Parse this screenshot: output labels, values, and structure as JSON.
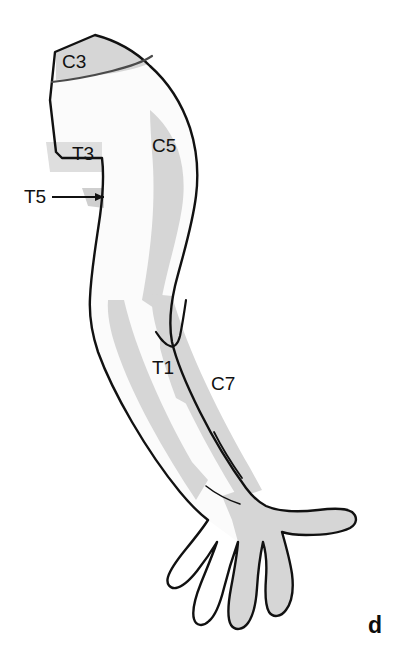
{
  "figure": {
    "panel_letter": "d",
    "colors": {
      "background": "#ffffff",
      "skin_light": "#fbfbfb",
      "dermatome_shade": "#d6d6d6",
      "dermatome_shade_soft": "#dedede",
      "outline": "#111111",
      "label_text": "#111111"
    },
    "labels": [
      {
        "id": "c3",
        "text": "C3",
        "x": 62,
        "y": 68
      },
      {
        "id": "c5",
        "text": "C5",
        "x": 152,
        "y": 152
      },
      {
        "id": "t3",
        "text": "T3",
        "x": 72,
        "y": 160
      },
      {
        "id": "t5",
        "text": "T5",
        "x": 24,
        "y": 203
      },
      {
        "id": "t1",
        "text": "T1",
        "x": 152,
        "y": 374
      },
      {
        "id": "c7",
        "text": "C7",
        "x": 211,
        "y": 390
      }
    ],
    "leader_lines": [
      {
        "id": "t5-leader",
        "from_x": 52,
        "from_y": 197,
        "to_x": 104,
        "to_y": 197
      }
    ],
    "shapes": {
      "body_outline": "M 55 52 L 95 35 C 118 41 136 52 150 66 C 168 82 182 104 190 128 C 197 150 199 172 196 196 C 192 228 182 258 175 286 C 170 308 169 326 172 342 C 177 364 188 388 200 412 C 214 440 230 466 246 488 C 252 496 258 502 266 506 C 280 512 300 512 318 510 C 334 508 346 508 352 512 C 358 517 357 524 350 528 C 340 533 322 535 306 535 C 296 535 288 534 282 532 C 286 546 290 560 292 574 C 294 590 292 602 286 610 C 281 617 273 618 269 612 C 265 605 265 592 266 578 C 267 564 266 552 263 542 C 260 556 258 572 257 588 C 256 604 253 616 248 623 C 243 630 235 631 231 625 C 227 618 228 604 231 588 C 234 572 237 556 238 542 C 233 556 228 572 224 588 C 220 604 215 616 209 621 C 203 627 196 626 194 619 C 192 612 195 598 201 583 C 207 568 213 554 217 542 C 211 552 204 562 197 571 C 189 581 182 587 176 588 C 170 589 166 584 168 577 C 170 570 177 560 186 549 C 195 538 203 528 208 520 C 200 514 190 504 180 492 C 162 470 146 446 132 422 C 118 398 106 374 98 352 C 92 334 89 316 90 298 C 91 272 96 244 100 216 C 103 194 104 174 102 158 L 62 158 L 56 152 L 50 100 Z",
      "skin_base": "M 55 52 L 95 35 C 118 41 136 52 150 66 C 168 82 182 104 190 128 C 197 150 199 172 196 196 C 192 228 182 258 175 286 C 170 308 169 326 172 342 C 177 364 188 388 200 412 C 214 440 230 466 246 488 L 266 506 L 282 532 L 238 542 L 208 520 L 180 492 C 162 470 146 446 132 422 C 118 398 106 374 98 352 C 92 334 89 316 90 298 C 91 272 96 244 100 216 C 103 194 104 174 102 158 L 62 158 L 56 152 L 50 100 Z",
      "c3_patch": "M 56 52 L 96 35 C 116 41 134 51 148 64 C 138 68 122 72 106 74 C 86 77 68 79 56 80 Z",
      "c3_line": "M 52 82 C 70 80 92 76 112 71 C 132 66 146 60 152 56",
      "c5_patch": "M 150 110 C 162 120 172 134 178 150 C 184 168 185 188 182 208 C 179 228 173 250 168 270 C 164 286 161 300 160 312 L 142 300 C 146 278 150 252 152 226 C 154 200 154 174 152 152 C 151 136 150 122 150 110 Z",
      "c5_patch_lower": "M 160 320 C 166 338 174 358 182 376 C 188 390 192 400 194 408 L 176 398 C 170 382 164 364 160 348 Z",
      "t3_patch": "M 46 142 L 102 142 L 102 172 L 50 172 Z",
      "t5_patch": "M 82 188 L 104 188 L 104 208 L 88 206 Z",
      "t1_band": "M 124 300 C 130 326 140 354 152 382 C 164 410 178 438 192 462 L 208 480 L 196 500 C 180 476 164 450 150 424 C 136 398 124 372 116 348 C 110 330 107 314 108 300 Z",
      "c7_band": "M 172 296 C 180 324 192 354 206 384 C 220 414 236 444 250 468 L 262 490 L 238 498 C 222 472 206 444 192 416 C 178 388 166 360 158 334 C 153 318 151 304 152 294 Z",
      "hand_shade": "M 246 488 C 252 496 258 502 266 506 C 280 512 300 512 318 510 C 334 508 346 508 352 512 C 358 517 357 524 350 528 C 340 533 322 535 306 535 C 296 535 288 534 282 532 C 286 546 290 560 292 574 C 294 590 292 602 286 610 C 281 617 273 618 269 612 C 265 605 265 592 266 578 C 267 564 266 552 263 542 C 260 556 258 572 257 588 C 256 604 253 616 248 623 C 243 630 235 631 231 625 C 227 618 228 604 231 588 C 234 572 237 556 238 542 L 232 520 L 222 496 Z",
      "elbow_crease": "M 186 300 C 184 314 182 326 180 336 C 178 344 174 348 170 346 C 164 344 160 338 156 332",
      "forearm_crease": "M 214 432 C 222 448 232 464 242 478",
      "wrist_line": "M 206 486 C 216 494 228 500 240 504"
    }
  }
}
